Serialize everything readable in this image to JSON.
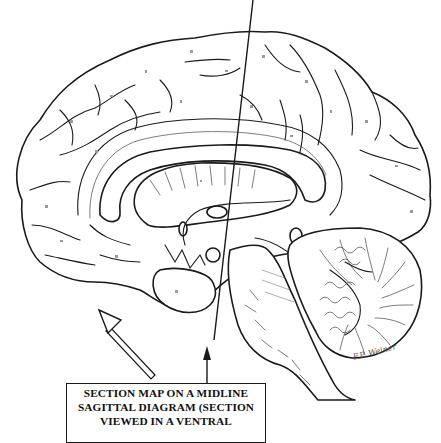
{
  "figure": {
    "type": "neuroanatomy-line-illustration",
    "background_color": "#ffffff",
    "ink_color": "#1a1a1a"
  },
  "section_line": {
    "description": "oblique section plane line crossing the brain",
    "start": {
      "x": 253,
      "y": 0
    },
    "end": {
      "x": 207,
      "y": 375
    },
    "arrowhead": {
      "x": 207,
      "y": 348,
      "direction": "up"
    }
  },
  "view_arrow": {
    "description": "open (outlined) arrow indicating viewing direction",
    "tail": {
      "x": 155,
      "y": 373
    },
    "head": {
      "x": 100,
      "y": 313
    },
    "direction": "up-left"
  },
  "structures": [
    {
      "id": "cerebral-cortex-medial",
      "label": "Cerebral hemisphere (medial surface, gyri and sulci)"
    },
    {
      "id": "cingulate-gyrus",
      "label": "Cingulate gyrus"
    },
    {
      "id": "corpus-callosum",
      "label": "Corpus callosum"
    },
    {
      "id": "fornix",
      "label": "Fornix"
    },
    {
      "id": "thalamus",
      "label": "Thalamus"
    },
    {
      "id": "hypothalamus",
      "label": "Hypothalamus"
    },
    {
      "id": "pineal",
      "label": "Pineal body"
    },
    {
      "id": "midbrain",
      "label": "Midbrain"
    },
    {
      "id": "pons",
      "label": "Pons"
    },
    {
      "id": "medulla",
      "label": "Medulla oblongata"
    },
    {
      "id": "cerebellum",
      "label": "Cerebellum (arbor vitae)"
    },
    {
      "id": "temporal-lobe",
      "label": "Temporal lobe / uncus"
    }
  ],
  "caption": {
    "lines": [
      "SECTION MAP ON A MIDLINE",
      "SAGITTAL DIAGRAM (SECTION",
      "VIEWED IN A VENTRAL"
    ]
  },
  "signature": {
    "text": "F.P. Weiner"
  }
}
